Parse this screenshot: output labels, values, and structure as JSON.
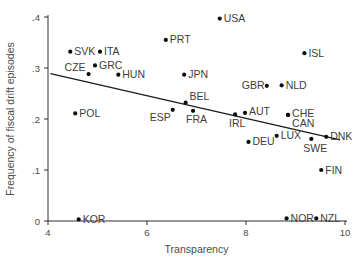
{
  "chart_data": {
    "type": "scatter",
    "title": "",
    "xlabel": "Transparency",
    "ylabel": "Frequency of fiscal drift episodes",
    "xlim": [
      4,
      10
    ],
    "ylim": [
      0,
      0.4
    ],
    "grid": false,
    "legend": "none",
    "xticks": [
      {
        "value": 4,
        "label": "4"
      },
      {
        "value": 6,
        "label": "6"
      },
      {
        "value": 8,
        "label": "8"
      },
      {
        "value": 10,
        "label": "10"
      }
    ],
    "yticks": [
      {
        "value": 0,
        "label": "0"
      },
      {
        "value": 0.1,
        "label": ".1"
      },
      {
        "value": 0.2,
        "label": ".2"
      },
      {
        "value": 0.3,
        "label": ".3"
      },
      {
        "value": 0.4,
        "label": ".4"
      }
    ],
    "point_color": "#0d0d0d",
    "line_color": "#1a1a1a",
    "fit_line": {
      "x": [
        4.05,
        9.9
      ],
      "y": [
        0.289,
        0.159
      ]
    },
    "points": [
      {
        "label": "SVK",
        "x": 4.45,
        "y": 0.332,
        "label_dx": 4,
        "label_dy": 3.5
      },
      {
        "label": "ITA",
        "x": 5.05,
        "y": 0.332,
        "label_dx": 4,
        "label_dy": 3.5
      },
      {
        "label": "GRC",
        "x": 4.95,
        "y": 0.305,
        "label_dx": 4,
        "label_dy": 3.5
      },
      {
        "label": "CZE",
        "x": 4.82,
        "y": 0.288,
        "label_dx": -24,
        "label_dy": -3
      },
      {
        "label": "HUN",
        "x": 5.42,
        "y": 0.287,
        "label_dx": 4,
        "label_dy": 3.5
      },
      {
        "label": "POL",
        "x": 4.55,
        "y": 0.211,
        "label_dx": 4,
        "label_dy": 3.5
      },
      {
        "label": "KOR",
        "x": 4.62,
        "y": 0.003,
        "label_dx": 4,
        "label_dy": 3.5
      },
      {
        "label": "PRT",
        "x": 6.38,
        "y": 0.355,
        "label_dx": 4,
        "label_dy": 3.5
      },
      {
        "label": "USA",
        "x": 7.47,
        "y": 0.397,
        "label_dx": 4,
        "label_dy": 3.5
      },
      {
        "label": "JPN",
        "x": 6.75,
        "y": 0.287,
        "label_dx": 4,
        "label_dy": 3.5
      },
      {
        "label": "BEL",
        "x": 6.78,
        "y": 0.232,
        "label_dx": 4,
        "label_dy": -3
      },
      {
        "label": "ESP",
        "x": 6.52,
        "y": 0.218,
        "label_dx": -23,
        "label_dy": 11
      },
      {
        "label": "FRA",
        "x": 6.93,
        "y": 0.216,
        "label_dx": -7,
        "label_dy": 12
      },
      {
        "label": "IRL",
        "x": 7.78,
        "y": 0.209,
        "label_dx": -6,
        "label_dy": 13
      },
      {
        "label": "AUT",
        "x": 7.98,
        "y": 0.212,
        "label_dx": 4,
        "label_dy": 2
      },
      {
        "label": "GBR",
        "x": 8.42,
        "y": 0.265,
        "label_dx": -25,
        "label_dy": 3.5
      },
      {
        "label": "NLD",
        "x": 8.72,
        "y": 0.266,
        "label_dx": 4,
        "label_dy": 3.5
      },
      {
        "label": "ISL",
        "x": 9.18,
        "y": 0.329,
        "label_dx": 4,
        "label_dy": 3.5
      },
      {
        "label": "CHE",
        "x": 8.85,
        "y": 0.208,
        "label_dx": 4,
        "label_dy": 2
      },
      {
        "label": "CAN",
        "x": 8.85,
        "y": 0.208,
        "label_dx": 4,
        "label_dy": 12
      },
      {
        "label": "DEU",
        "x": 8.05,
        "y": 0.155,
        "label_dx": 4,
        "label_dy": 3.5
      },
      {
        "label": "LUX",
        "x": 8.62,
        "y": 0.167,
        "label_dx": 4,
        "label_dy": 3.5
      },
      {
        "label": "SWE",
        "x": 9.32,
        "y": 0.161,
        "label_dx": -8,
        "label_dy": 13
      },
      {
        "label": "DNK",
        "x": 9.62,
        "y": 0.165,
        "label_dx": 4,
        "label_dy": 3.5
      },
      {
        "label": "FIN",
        "x": 9.52,
        "y": 0.1,
        "label_dx": 4,
        "label_dy": 3.5
      },
      {
        "label": "NOR",
        "x": 8.82,
        "y": 0.005,
        "label_dx": 4,
        "label_dy": 3.5
      },
      {
        "label": "NZL",
        "x": 9.42,
        "y": 0.005,
        "label_dx": 4,
        "label_dy": 3.5
      }
    ]
  }
}
